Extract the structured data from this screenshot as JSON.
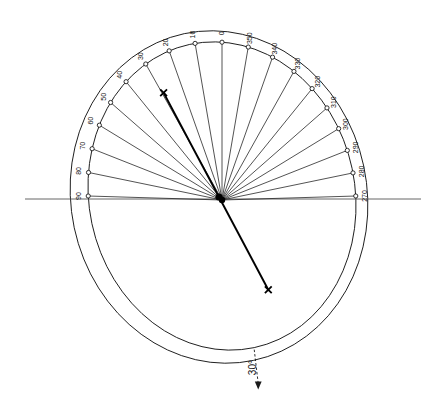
{
  "figure": {
    "title": "",
    "background_color": "#ffffff",
    "line_color": "#1a1a1a",
    "bold_color": "#000000",
    "annotation": {
      "label": "30°",
      "name": "rotation-annotation"
    }
  },
  "chart_data": {
    "type": "scatter",
    "title": "",
    "xlabel": "",
    "ylabel": "",
    "coordinate_system": "polar-azimuth",
    "grid": false,
    "legend": "none",
    "center": {
      "x": 219,
      "y": 197
    },
    "center_secondary": {
      "x": 222,
      "y": 200
    },
    "outer_ellipse": {
      "cx": 219,
      "cy": 197,
      "rx": 148,
      "ry": 167,
      "rotation": -12
    },
    "inner_ellipse": {
      "cx": 222,
      "cy": 196,
      "rx": 133,
      "ry": 155,
      "rotation": -12
    },
    "horizontal_axis": {
      "x1": 25,
      "y1": 199,
      "x2": 421,
      "y2": 199
    },
    "azimuth_ticks": [
      {
        "label": "0",
        "angle_deg": 0
      },
      {
        "label": "10",
        "angle_deg": 10
      },
      {
        "label": "20",
        "angle_deg": 20
      },
      {
        "label": "30",
        "angle_deg": 30
      },
      {
        "label": "40",
        "angle_deg": 40
      },
      {
        "label": "50",
        "angle_deg": 50
      },
      {
        "label": "60",
        "angle_deg": 60
      },
      {
        "label": "70",
        "angle_deg": 70
      },
      {
        "label": "80",
        "angle_deg": 80
      },
      {
        "label": "90",
        "angle_deg": 90
      },
      {
        "label": "270",
        "angle_deg": 270
      },
      {
        "label": "280",
        "angle_deg": 280
      },
      {
        "label": "290",
        "angle_deg": 290
      },
      {
        "label": "300",
        "angle_deg": 300
      },
      {
        "label": "310",
        "angle_deg": 310
      },
      {
        "label": "320",
        "angle_deg": 320
      },
      {
        "label": "330",
        "angle_deg": 330
      },
      {
        "label": "340",
        "angle_deg": 340
      },
      {
        "label": "350",
        "angle_deg": 350
      }
    ],
    "vectors": [
      {
        "name": "vector-upper-right",
        "angle_deg": 28,
        "length": 118,
        "marker": "x"
      },
      {
        "name": "vector-lower-left",
        "angle_deg": 208,
        "length": 105,
        "marker": "x"
      }
    ]
  }
}
